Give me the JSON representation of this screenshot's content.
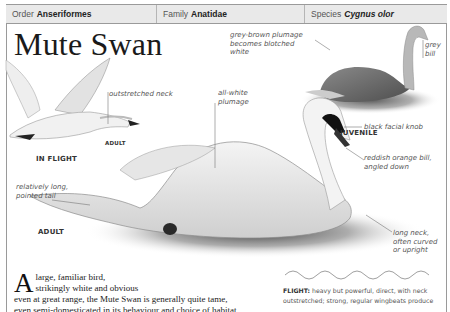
{
  "taxonomy": {
    "order": {
      "label": "Order",
      "value": "Anseriformes"
    },
    "family": {
      "label": "Family",
      "value": "Anatidae"
    },
    "species": {
      "label": "Species",
      "value": "Cygnus olor"
    }
  },
  "title": "Mute Swan",
  "figures": {
    "flight": {
      "caption": "IN FLIGHT",
      "age": "ADULT",
      "annotation": "outstretched neck"
    },
    "juvenile": {
      "caption": "JUVENILE",
      "annotations": [
        "grey-brown plumage becomes blotched white",
        "grey bill"
      ]
    },
    "adult": {
      "caption": "ADULT",
      "annotations": [
        "all-white plumage",
        "black facial knob",
        "reddish orange bill, angled down",
        "relatively long, pointed tail",
        "long neck, often curved or upright"
      ]
    }
  },
  "body_text": {
    "drop_cap": "A",
    "line1": "large, familiar bird,",
    "line2": "strikingly white and obvious",
    "rest": "even at great range, the Mute Swan is generally quite tame, even semi-domesticated in its behaviour and choice of habitat. Territorial"
  },
  "flight_info": {
    "label": "FLIGHT:",
    "text": "heavy but powerful, direct, with neck outstretched; strong, regular wingbeats produce"
  }
}
